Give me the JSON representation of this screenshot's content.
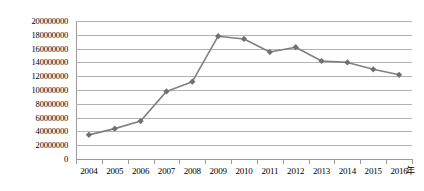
{
  "chart_data": {
    "type": "line",
    "title": "",
    "subtitle": "",
    "xlabel": "年",
    "ylabel": "",
    "categories": [
      "2004",
      "2005",
      "2006",
      "2007",
      "2008",
      "2009",
      "2010",
      "2011",
      "2012",
      "2013",
      "2014",
      "2015",
      "2016"
    ],
    "values": [
      35000000,
      44000000,
      55000000,
      98000000,
      112000000,
      178000000,
      174000000,
      155000000,
      162000000,
      142000000,
      140000000,
      130000000,
      122000000
    ],
    "series": [
      {
        "name": "",
        "values": [
          35000000,
          44000000,
          55000000,
          98000000,
          112000000,
          178000000,
          174000000,
          155000000,
          162000000,
          142000000,
          140000000,
          130000000,
          122000000
        ]
      }
    ],
    "ylim": [
      0,
      200000000
    ],
    "ytick_values": [
      0,
      20000000,
      40000000,
      60000000,
      80000000,
      100000000,
      120000000,
      140000000,
      160000000,
      180000000,
      200000000
    ],
    "ytick_labels": [
      "0",
      "20000000",
      "40000000",
      "60000000",
      "80000000",
      "100000000",
      "120000000",
      "140000000",
      "160000000",
      "180000000",
      "200000000"
    ],
    "grid": "horizontal",
    "legend": "none",
    "marker": "diamond",
    "line_color": "#808080",
    "marker_color": "#707070",
    "gridline_color": "#b3b3b3",
    "axis_color": "#9a9a9a",
    "plot_background": "#ffffff"
  }
}
